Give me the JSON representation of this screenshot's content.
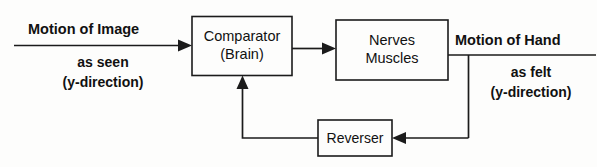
{
  "diagram": {
    "colors": {
      "ink": "#1b1b1b",
      "text": "#111111",
      "background": "#fdfdfc"
    },
    "blocks": [
      {
        "id": "comparator",
        "line1": "Comparator",
        "line2": "(Brain)"
      },
      {
        "id": "nerves",
        "line1": "Nerves",
        "line2": "Muscles"
      },
      {
        "id": "reverser",
        "line1": "Reverser",
        "line2": ""
      }
    ],
    "input_label": {
      "line1": "Motion of Image",
      "line2": "as seen",
      "line3": "(y-direction)"
    },
    "output_label": {
      "line1": "Motion of Hand",
      "line2": "as felt",
      "line3": "(y-direction)"
    },
    "connectors": [
      {
        "id": "input-to-comparator",
        "kind": "arrow",
        "direction": "right"
      },
      {
        "id": "comparator-to-nerves",
        "kind": "arrow",
        "direction": "right"
      },
      {
        "id": "nerves-to-output",
        "kind": "line",
        "direction": "right"
      },
      {
        "id": "output-tap-down",
        "kind": "line",
        "direction": "down"
      },
      {
        "id": "output-to-reverser",
        "kind": "arrow",
        "direction": "left"
      },
      {
        "id": "reverser-to-comparator",
        "kind": "arrow",
        "direction": "up"
      }
    ]
  }
}
